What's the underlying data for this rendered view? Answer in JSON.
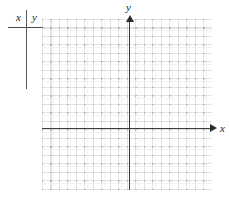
{
  "figure": {
    "type": "coordinate-grid"
  },
  "value_table": {
    "name": "xy-value-table",
    "columns": [
      "x",
      "y"
    ],
    "rows": []
  },
  "axes": {
    "x_label": "x",
    "y_label": "y",
    "x_arrow": "arrow-right-icon",
    "y_arrow": "arrow-up-icon"
  },
  "chart_data": {
    "type": "scatter",
    "title": "",
    "xlabel": "x",
    "ylabel": "y",
    "x": [],
    "y": [],
    "series": [],
    "grid": true,
    "grid_style": "dotted",
    "grid_spacing": 1,
    "xlim": [
      -10,
      10
    ],
    "ylim": [
      -7,
      13
    ],
    "legend": "none",
    "annotations": []
  },
  "colors": {
    "axis": "#3c3c3c",
    "grid": "#9a9a9a",
    "table_rule": "#4a4a4a",
    "text": "#1a1a1a",
    "background": "#ffffff"
  }
}
